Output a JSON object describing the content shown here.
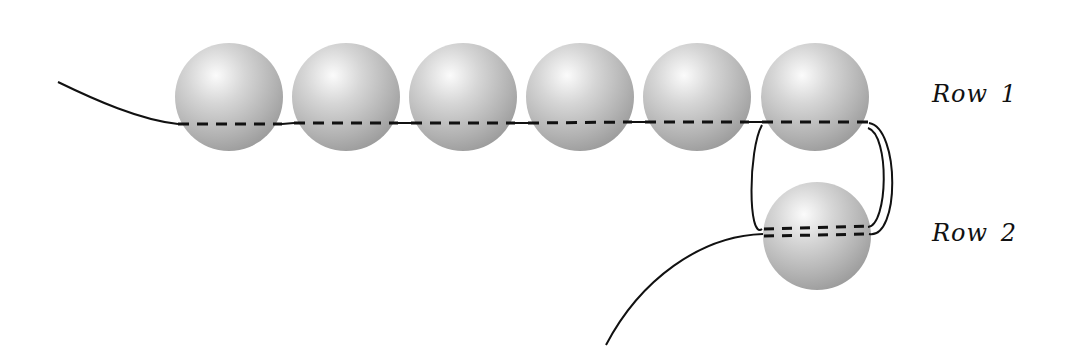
{
  "diagram": {
    "colors": {
      "background": "#ffffff",
      "bead_highlight": "#fafafa",
      "bead_mid": "#c4c4c4",
      "bead_shadow": "#8f8f8f",
      "thread": "#111111"
    },
    "labels": {
      "row1": "Row 1",
      "row2": "Row 2"
    },
    "beads": [
      {
        "id": "bead-1",
        "row": 1,
        "cx": 229,
        "cy": 97,
        "r": 54
      },
      {
        "id": "bead-2",
        "row": 1,
        "cx": 346,
        "cy": 97,
        "r": 54
      },
      {
        "id": "bead-3",
        "row": 1,
        "cx": 463,
        "cy": 97,
        "r": 54
      },
      {
        "id": "bead-4",
        "row": 1,
        "cx": 580,
        "cy": 97,
        "r": 54
      },
      {
        "id": "bead-5",
        "row": 1,
        "cx": 697,
        "cy": 97,
        "r": 54
      },
      {
        "id": "bead-6",
        "row": 1,
        "cx": 815,
        "cy": 97,
        "r": 54
      },
      {
        "id": "bead-7",
        "row": 2,
        "cx": 817,
        "cy": 236,
        "r": 54
      }
    ]
  }
}
